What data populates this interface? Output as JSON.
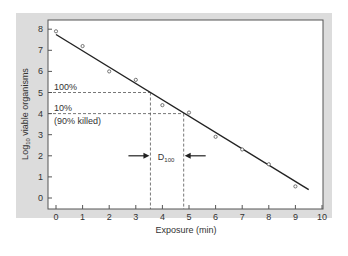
{
  "chart_data": {
    "type": "scatter",
    "title": "",
    "xlabel": "Exposure (min)",
    "ylabel_main": "Log",
    "ylabel_sub": "10",
    "ylabel_rest": " viable organisms",
    "xlim": [
      0,
      10
    ],
    "ylim": [
      0,
      8
    ],
    "xticks": [
      "0",
      "1",
      "2",
      "3",
      "4",
      "5",
      "6",
      "7",
      "8",
      "9",
      "10"
    ],
    "yticks": [
      "0",
      "1",
      "2",
      "3",
      "4",
      "5",
      "6",
      "7",
      "8"
    ],
    "points": [
      {
        "x": 0,
        "y": 7.9
      },
      {
        "x": 1,
        "y": 7.2
      },
      {
        "x": 2,
        "y": 6.0
      },
      {
        "x": 3,
        "y": 5.6
      },
      {
        "x": 4,
        "y": 4.4
      },
      {
        "x": 5,
        "y": 4.05
      },
      {
        "x": 6,
        "y": 2.9
      },
      {
        "x": 7,
        "y": 2.3
      },
      {
        "x": 8,
        "y": 1.6
      },
      {
        "x": 9,
        "y": 0.55
      }
    ],
    "fit_line": {
      "x1": 0,
      "y1": 7.75,
      "x2": 9.5,
      "y2": 0.4
    },
    "reference_lines": [
      {
        "y": 5,
        "x_end": 3.55,
        "label": "100%"
      },
      {
        "y": 4,
        "x_end": 4.8,
        "label": "10%",
        "sublabel": "(90% killed)"
      }
    ],
    "d_value": {
      "x_start": 3.55,
      "x_end": 4.8,
      "label_main": "D",
      "label_sub": "100",
      "y": 2
    }
  },
  "colors": {
    "panel_bg": "#dcdcdc",
    "plot_bg": "#ffffff",
    "line": "#222222",
    "dashed": "#555555",
    "text": "#333333"
  }
}
